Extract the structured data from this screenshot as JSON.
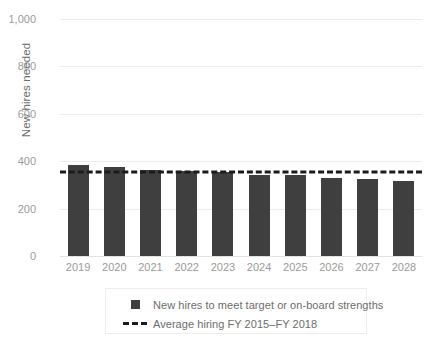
{
  "chart_data": {
    "type": "bar",
    "title": "",
    "xlabel": "",
    "ylabel": "New hires needed",
    "ylim": [
      0,
      1000
    ],
    "yticks": [
      0,
      200,
      400,
      600,
      800,
      1000
    ],
    "ytick_labels": [
      "0",
      "200",
      "400",
      "600",
      "800",
      "1,000"
    ],
    "grid": true,
    "legend_position": "bottom-center",
    "categories": [
      "2019",
      "2020",
      "2021",
      "2022",
      "2023",
      "2024",
      "2025",
      "2026",
      "2027",
      "2028"
    ],
    "series": [
      {
        "name": "New hires to meet target or on-board strengths",
        "type": "bar",
        "color": "#3f3f3f",
        "values": [
          385,
          375,
          362,
          360,
          355,
          342,
          341,
          330,
          327,
          318
        ]
      },
      {
        "name": "Average hiring FY 2015–FY 2018",
        "type": "hline",
        "color": "#1b1b1b",
        "style": "dashed",
        "value": 354
      }
    ],
    "annotations": []
  },
  "legend": {
    "items": [
      {
        "marker": "filled-square",
        "label": "New hires to meet target or on-board strengths"
      },
      {
        "marker": "dashed-line",
        "label": "Average hiring FY 2015–FY 2018"
      }
    ]
  },
  "colors": {
    "bar": "#3f3f3f",
    "average_line": "#1b1b1b",
    "gridline": "#ececec",
    "tick_text": "#9b9b9b",
    "axis_title_text": "#6d6d6d",
    "legend_border": "#ededed",
    "background": "#ffffff"
  }
}
